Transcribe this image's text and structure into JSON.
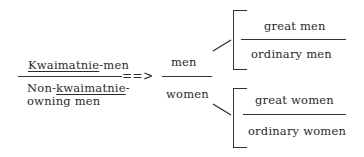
{
  "diagram": {
    "left_fraction": {
      "numerator": {
        "underlined": "Kwaimatnie",
        "rest": "-men"
      },
      "denominator": {
        "prefix": "Non-",
        "underlined": "kwaimatnie",
        "line1_rest": "-",
        "line2": "owning men"
      }
    },
    "arrow": "==>",
    "middle_fraction": {
      "numerator": "men",
      "denominator": "women"
    },
    "upper_bracket": {
      "top": "great men",
      "bottom": "ordinary men"
    },
    "lower_bracket": {
      "top": "great women",
      "bottom": "ordinary women"
    }
  }
}
